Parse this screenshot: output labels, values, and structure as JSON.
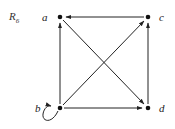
{
  "title": {
    "main": "R",
    "subscript": "6"
  },
  "colors": {
    "stroke": "#222222",
    "node": "#111111",
    "background": "#ffffff"
  },
  "nodes": [
    {
      "id": "a",
      "label": "a",
      "x": 60,
      "y": 17
    },
    {
      "id": "b",
      "label": "b",
      "x": 60,
      "y": 108
    },
    {
      "id": "c",
      "label": "c",
      "x": 148,
      "y": 17
    },
    {
      "id": "d",
      "label": "d",
      "x": 148,
      "y": 108
    }
  ],
  "edges": [
    {
      "from": "c",
      "to": "a"
    },
    {
      "from": "b",
      "to": "a"
    },
    {
      "from": "d",
      "to": "c"
    },
    {
      "from": "b",
      "to": "d"
    },
    {
      "from": "a",
      "to": "d"
    },
    {
      "from": "b",
      "to": "c"
    },
    {
      "from": "b",
      "to": "b",
      "self_loop": true
    }
  ]
}
